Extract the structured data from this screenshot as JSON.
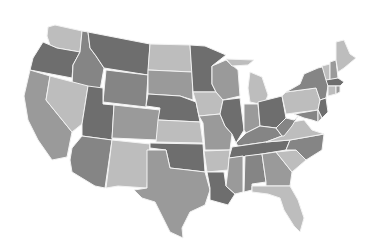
{
  "map": {
    "title": "United States",
    "style": "grayscale choropleth",
    "colors": {
      "dark": "#6e6e6e",
      "mid_dark": "#858585",
      "mid": "#9a9a9a",
      "light": "#bdbdbd",
      "border": "#f2f2f2"
    },
    "states": [
      {
        "id": "WA",
        "fill": "#bdbdbd",
        "d": "M48,27 L55,25 L82,31 L80,52 L57,48 L50,45 L47,36 Z"
      },
      {
        "id": "OR",
        "fill": "#6e6e6e",
        "d": "M43,42 L57,48 L80,52 L73,65 L72,78 L30,70 L33,58 Z"
      },
      {
        "id": "CA",
        "fill": "#9a9a9a",
        "d": "M30,70 L50,76 L46,100 L72,132 L70,142 L67,157 L52,160 L38,140 L28,120 L24,96 Z"
      },
      {
        "id": "ID",
        "fill": "#858585",
        "d": "M82,31 L88,32 L90,48 L96,56 L104,68 L100,90 L72,86 L73,65 L80,52 Z"
      },
      {
        "id": "NV",
        "fill": "#bdbdbd",
        "d": "M50,76 L88,86 L82,124 L72,132 L46,100 Z"
      },
      {
        "id": "MT",
        "fill": "#6e6e6e",
        "d": "M88,32 L150,44 L148,75 L104,68 L96,56 L90,48 Z"
      },
      {
        "id": "WY",
        "fill": "#858585",
        "d": "M106,70 L148,75 L146,107 L103,102 Z"
      },
      {
        "id": "UT",
        "fill": "#6e6e6e",
        "d": "M88,86 L103,88 L103,104 L114,105 L112,140 L82,136 L82,124 Z"
      },
      {
        "id": "AZ",
        "fill": "#858585",
        "d": "M82,136 L112,140 L105,188 L95,186 L72,172 L70,160 L72,148 Z"
      },
      {
        "id": "CO",
        "fill": "#9a9a9a",
        "d": "M114,105 L160,110 L158,140 L112,138 Z"
      },
      {
        "id": "NM",
        "fill": "#bdbdbd",
        "d": "M112,140 L150,144 L147,188 L118,186 L106,188 Z"
      },
      {
        "id": "ND",
        "fill": "#bdbdbd",
        "d": "M150,44 L190,45 L192,72 L148,70 Z"
      },
      {
        "id": "SD",
        "fill": "#9a9a9a",
        "d": "M148,70 L192,72 L193,100 L180,96 L148,94 Z"
      },
      {
        "id": "NE",
        "fill": "#6e6e6e",
        "d": "M148,94 L180,96 L196,102 L200,122 L158,120 L160,108 L146,106 Z"
      },
      {
        "id": "KS",
        "fill": "#bdbdbd",
        "d": "M158,120 L200,122 L203,143 L156,142 Z"
      },
      {
        "id": "OK",
        "fill": "#6e6e6e",
        "d": "M150,143 L203,144 L205,172 L188,170 L170,168 L166,150 L150,148 Z"
      },
      {
        "id": "TX",
        "fill": "#9a9a9a",
        "d": "M147,150 L166,150 L170,168 L188,170 L205,172 L210,190 L205,205 L190,212 L182,228 L183,238 L170,232 L163,218 L155,202 L142,198 L134,190 L147,188 Z"
      },
      {
        "id": "MN",
        "fill": "#6e6e6e",
        "d": "M190,45 L205,46 L226,55 L212,66 L212,84 L216,92 L193,92 Z"
      },
      {
        "id": "IA",
        "fill": "#bdbdbd",
        "d": "M193,92 L216,92 L223,100 L220,114 L199,116 L196,102 Z"
      },
      {
        "id": "MO",
        "fill": "#9a9a9a",
        "d": "M199,116 L220,114 L225,126 L232,134 L230,150 L205,150 L203,123 Z"
      },
      {
        "id": "AR",
        "fill": "#bdbdbd",
        "d": "M204,151 L230,150 L228,170 L207,172 Z"
      },
      {
        "id": "LA",
        "fill": "#6e6e6e",
        "d": "M207,172 L224,172 L226,186 L235,194 L228,205 L210,200 L210,188 Z"
      },
      {
        "id": "WI",
        "fill": "#9a9a9a",
        "d": "M212,66 L226,60 L238,70 L240,96 L223,100 L216,92 L212,84 Z"
      },
      {
        "id": "IL",
        "fill": "#6e6e6e",
        "d": "M223,100 L240,98 L244,130 L236,143 L232,134 L225,126 L220,114 Z"
      },
      {
        "id": "MI",
        "fill": "#bdbdbd",
        "d": "M250,72 L262,77 L268,95 L264,105 L250,102 L248,88 Z M226,59 L254,60 L248,65 L232,66 Z"
      },
      {
        "id": "IN",
        "fill": "#9a9a9a",
        "d": "M244,104 L258,104 L260,126 L246,133 L244,130 Z"
      },
      {
        "id": "OH",
        "fill": "#6e6e6e",
        "d": "M258,102 L282,96 L286,118 L276,128 L260,126 Z"
      },
      {
        "id": "KY",
        "fill": "#858585",
        "d": "M236,143 L246,133 L260,126 L276,128 L282,136 L266,142 L238,146 Z"
      },
      {
        "id": "TN",
        "fill": "#6e6e6e",
        "d": "M232,147 L266,142 L290,140 L286,150 L250,156 L229,158 Z"
      },
      {
        "id": "MS",
        "fill": "#9a9a9a",
        "d": "M229,158 L243,156 L243,192 L235,194 L226,186 L228,170 Z"
      },
      {
        "id": "AL",
        "fill": "#858585",
        "d": "M245,156 L262,154 L266,182 L252,184 L252,190 L244,192 Z"
      },
      {
        "id": "GA",
        "fill": "#9a9a9a",
        "d": "M262,154 L276,152 L292,172 L290,186 L266,186 L266,182 Z"
      },
      {
        "id": "FL",
        "fill": "#bdbdbd",
        "d": "M252,186 L290,186 L298,200 L304,218 L300,232 L294,226 L284,210 L280,198 L268,194 L252,192 Z"
      },
      {
        "id": "SC",
        "fill": "#bdbdbd",
        "d": "M276,152 L296,150 L306,160 L292,172 Z"
      },
      {
        "id": "NC",
        "fill": "#858585",
        "d": "M286,150 L290,140 L324,134 L322,150 L306,160 L296,150 Z"
      },
      {
        "id": "VA",
        "fill": "#bdbdbd",
        "d": "M266,142 L282,136 L292,122 L304,120 L312,130 L324,134 L290,140 Z"
      },
      {
        "id": "WV",
        "fill": "#858585",
        "d": "M276,128 L286,118 L294,120 L298,116 L292,126 L284,136 L282,136 Z"
      },
      {
        "id": "PA",
        "fill": "#bdbdbd",
        "d": "M282,96 L286,92 L316,88 L320,100 L318,110 L286,114 Z"
      },
      {
        "id": "NY",
        "fill": "#858585",
        "d": "M286,92 L300,84 L304,74 L318,68 L326,66 L328,86 L326,98 L320,100 L316,88 Z"
      },
      {
        "id": "NJ",
        "fill": "#6e6e6e",
        "d": "M320,100 L326,98 L328,112 L322,118 L318,110 Z"
      },
      {
        "id": "MD",
        "fill": "#858585",
        "d": "M294,114 L318,110 L318,122 L312,120 L304,118 Z"
      },
      {
        "id": "DE",
        "fill": "#9a9a9a",
        "d": "M318,110 L322,118 L318,122 Z"
      },
      {
        "id": "VT",
        "fill": "#bdbdbd",
        "d": "M322,66 L330,64 L330,80 L326,80 Z"
      },
      {
        "id": "NH",
        "fill": "#9a9a9a",
        "d": "M330,62 L336,60 L338,78 L330,80 Z"
      },
      {
        "id": "ME",
        "fill": "#bdbdbd",
        "d": "M336,42 L344,40 L350,54 L356,58 L344,68 L338,72 L336,60 Z"
      },
      {
        "id": "MA",
        "fill": "#6e6e6e",
        "d": "M326,80 L338,78 L344,82 L340,86 L328,86 Z"
      },
      {
        "id": "CT",
        "fill": "#bdbdbd",
        "d": "M328,86 L336,86 L336,94 L328,96 Z"
      },
      {
        "id": "RI",
        "fill": "#9a9a9a",
        "d": "M336,86 L340,86 L340,92 L336,94 Z"
      }
    ]
  }
}
